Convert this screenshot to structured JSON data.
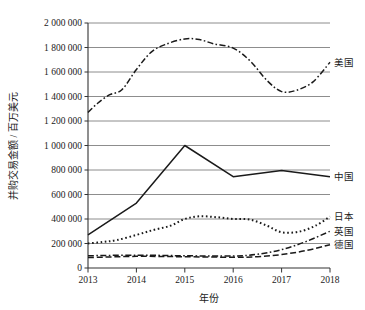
{
  "chart_data": {
    "type": "line",
    "title": "",
    "subtitle": "",
    "xlabel": "年份",
    "ylabel": "并购交易金额 / 百万美元",
    "x": [
      2013,
      2014,
      2015,
      2016,
      2017,
      2018
    ],
    "categories": [
      "2013",
      "2014",
      "2015",
      "2016",
      "2017",
      "2018"
    ],
    "xtick_labels": [
      "2013",
      "2014",
      "2015",
      "2016",
      "2017",
      "2018"
    ],
    "ytick_labels": [
      "0",
      "200 000",
      "400 000",
      "600 000",
      "800 000",
      "1 000 000",
      "1 200 000",
      "1 400 000",
      "1 600 000",
      "1 800 000",
      "2 000 000"
    ],
    "ytick_values": [
      0,
      200000,
      400000,
      600000,
      800000,
      1000000,
      1200000,
      1400000,
      1600000,
      1800000,
      2000000
    ],
    "ylim": [
      0,
      2000000
    ],
    "xlim": [
      2013,
      2018
    ],
    "grid": "horizontal",
    "legend_position": "right-inline",
    "line_color": "#1a1a1a",
    "grid_color": "#808080",
    "axis_color": "#333333",
    "series": [
      {
        "name": "美国",
        "label": "美国",
        "style": "dash-dot",
        "values": [
          1270000,
          1455000,
          1870000,
          1795000,
          1440000,
          1680000
        ],
        "dense_x": [
          2013,
          2013.2,
          2013.45,
          2013.7,
          2014,
          2014.3,
          2014.6,
          2015,
          2015.3,
          2015.6,
          2016,
          2016.35,
          2016.7,
          2017,
          2017.3,
          2017.65,
          2018
        ],
        "dense_y": [
          1270000,
          1345000,
          1415000,
          1455000,
          1620000,
          1760000,
          1825000,
          1870000,
          1865000,
          1830000,
          1795000,
          1690000,
          1530000,
          1440000,
          1450000,
          1520000,
          1680000
        ]
      },
      {
        "name": "中国",
        "label": "中国",
        "style": "solid",
        "values": [
          270000,
          530000,
          1000000,
          745000,
          795000,
          745000
        ],
        "dense_x": [
          2013,
          2014,
          2015,
          2016,
          2017,
          2018
        ],
        "dense_y": [
          270000,
          530000,
          1000000,
          745000,
          795000,
          745000
        ]
      },
      {
        "name": "日本",
        "label": "日本",
        "style": "dotted",
        "values": [
          200000,
          330000,
          420000,
          395000,
          290000,
          420000
        ],
        "dense_x": [
          2013,
          2013.3,
          2013.6,
          2014,
          2014.35,
          2014.7,
          2015,
          2015.3,
          2015.65,
          2016,
          2016.35,
          2016.7,
          2017,
          2017.35,
          2017.7,
          2018
        ],
        "dense_y": [
          200000,
          212000,
          228000,
          270000,
          310000,
          345000,
          400000,
          422000,
          415000,
          400000,
          395000,
          345000,
          292000,
          296000,
          345000,
          420000
        ]
      },
      {
        "name": "英国",
        "label": "英国",
        "style": "dash-dot",
        "values": [
          100000,
          105000,
          100000,
          98000,
          150000,
          300000
        ],
        "dense_x": [
          2013,
          2014,
          2015,
          2016,
          2016.5,
          2017,
          2017.5,
          2018
        ],
        "dense_y": [
          100000,
          105000,
          100000,
          98000,
          112000,
          150000,
          215000,
          300000
        ]
      },
      {
        "name": "德国",
        "label": "德国",
        "style": "dashed",
        "values": [
          85000,
          95000,
          92000,
          88000,
          110000,
          190000
        ],
        "dense_x": [
          2013,
          2014,
          2015,
          2016,
          2016.5,
          2017,
          2017.5,
          2018
        ],
        "dense_y": [
          85000,
          95000,
          92000,
          88000,
          92000,
          110000,
          142000,
          190000
        ]
      }
    ]
  }
}
